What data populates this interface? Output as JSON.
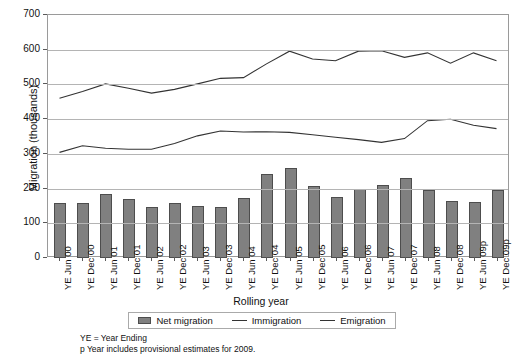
{
  "chart_data": {
    "type": "bar",
    "title": "",
    "xlabel": "Rolling year",
    "ylabel": "Migration (thousands)",
    "ylim": [
      0,
      700
    ],
    "yticks": [
      0,
      100,
      200,
      300,
      400,
      500,
      600,
      700
    ],
    "grid": true,
    "legend_position": "bottom",
    "categories": [
      "YE Jun 00",
      "YE Dec 00",
      "YE Jun 01",
      "YE Dec 01",
      "YE Jun 02",
      "YE Dec 02",
      "YE Jun 03",
      "YE Dec 03",
      "YE Jun 04",
      "YE Dec 04",
      "YE Jun 05",
      "YE Dec 05",
      "YE Jun 06",
      "YE Dec 06",
      "YE Jun 07",
      "YE Dec 07",
      "YE Jun 08",
      "YE Dec 08",
      "YE Jun 09p",
      "YE Dec 09p"
    ],
    "series": [
      {
        "name": "Net migration",
        "kind": "bar",
        "color": "#808080",
        "values": [
          158,
          157,
          185,
          170,
          147,
          157,
          150,
          147,
          172,
          243,
          258,
          206,
          176,
          198,
          209,
          231,
          195,
          163,
          160,
          196
        ]
      },
      {
        "name": "Immigration",
        "kind": "line",
        "color": "#333333",
        "values": [
          458,
          478,
          500,
          487,
          473,
          484,
          500,
          516,
          518,
          558,
          595,
          572,
          567,
          595,
          596,
          577,
          590,
          560,
          590,
          567
        ]
      },
      {
        "name": "Emigration",
        "kind": "line",
        "color": "#333333",
        "values": [
          301,
          320,
          313,
          310,
          310,
          327,
          349,
          363,
          360,
          361,
          359,
          352,
          345,
          338,
          330,
          341,
          393,
          397,
          380,
          370
        ]
      }
    ]
  },
  "legend": {
    "items": [
      {
        "label": "Net migration",
        "swatch": "bar-swatch"
      },
      {
        "label": "Immigration",
        "swatch": "line-swatch"
      },
      {
        "label": "Emigration",
        "swatch": "line-swatch"
      }
    ]
  },
  "footnotes": [
    "YE = Year Ending",
    "p  Year includes provisional estimates for 2009."
  ]
}
